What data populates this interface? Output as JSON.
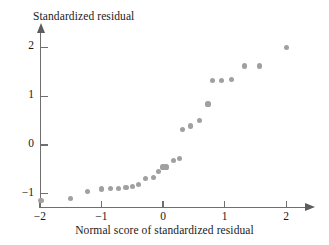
{
  "chart_data": {
    "type": "scatter",
    "title": "",
    "xlabel": "Normal score of standardized residual",
    "ylabel": "Standardized residual",
    "xlim": [
      -2.25,
      2.3
    ],
    "ylim": [
      -1.35,
      2.25
    ],
    "xticks": [
      -2,
      -1,
      0,
      1,
      2
    ],
    "xticklabels": [
      "−2",
      "−1",
      "0",
      "1",
      "2"
    ],
    "yticks": [
      -1,
      0,
      1,
      2
    ],
    "yticklabels": [
      "−1",
      "0",
      "1",
      "2"
    ],
    "grid": false,
    "legend": null,
    "marker_color": "#a0a0a0",
    "axis_color": "#6f6f6f",
    "points": [
      {
        "x": -1.98,
        "y": -1.14
      },
      {
        "x": -1.5,
        "y": -1.1
      },
      {
        "x": -1.22,
        "y": -0.95
      },
      {
        "x": -1.0,
        "y": -0.9
      },
      {
        "x": -0.85,
        "y": -0.89
      },
      {
        "x": -0.72,
        "y": -0.89
      },
      {
        "x": -0.6,
        "y": -0.87
      },
      {
        "x": -0.5,
        "y": -0.85
      },
      {
        "x": -0.4,
        "y": -0.81
      },
      {
        "x": -0.28,
        "y": -0.68
      },
      {
        "x": -0.16,
        "y": -0.66
      },
      {
        "x": -0.07,
        "y": -0.55
      },
      {
        "x": 0.0,
        "y": -0.45
      },
      {
        "x": 0.05,
        "y": -0.45
      },
      {
        "x": 0.17,
        "y": -0.31
      },
      {
        "x": 0.27,
        "y": -0.27
      },
      {
        "x": 0.32,
        "y": 0.31
      },
      {
        "x": 0.45,
        "y": 0.39
      },
      {
        "x": 0.59,
        "y": 0.51
      },
      {
        "x": 0.73,
        "y": 0.84
      },
      {
        "x": 0.8,
        "y": 1.32
      },
      {
        "x": 0.95,
        "y": 1.32
      },
      {
        "x": 1.11,
        "y": 1.34
      },
      {
        "x": 1.32,
        "y": 1.62
      },
      {
        "x": 1.57,
        "y": 1.62
      },
      {
        "x": 2.0,
        "y": 1.99
      }
    ]
  }
}
